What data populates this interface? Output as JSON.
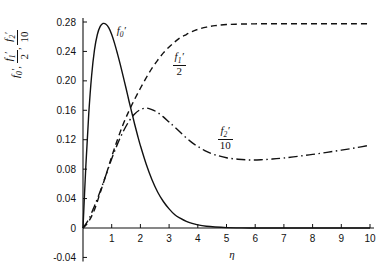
{
  "chart_data": {
    "type": "line",
    "title": "",
    "xlabel": "η",
    "ylabel": "f₀', f₁'/2, f₂'/10",
    "xlim": [
      -0.35,
      10.35
    ],
    "ylim": [
      -0.04,
      0.29
    ],
    "grid": false,
    "legend_position": "inline-annotations",
    "x_ticks": [
      "1",
      "2",
      "3",
      "4",
      "5",
      "6",
      "7",
      "8",
      "9",
      "10"
    ],
    "x_tick_values": [
      1,
      2,
      3,
      4,
      5,
      6,
      7,
      8,
      9,
      10
    ],
    "y_ticks": [
      "0.28",
      "0.24",
      "0.20",
      "0.16",
      "0.12",
      "0.08",
      "0.04",
      "0",
      "-0.04"
    ],
    "y_tick_values": [
      0.28,
      0.24,
      0.2,
      0.16,
      0.12,
      0.08,
      0.04,
      0,
      -0.04
    ],
    "series": [
      {
        "name": "f0prime",
        "label_num": "f",
        "label_sub": "0",
        "label_prime": "′",
        "style": "solid",
        "x": [
          0,
          0.1,
          0.2,
          0.3,
          0.4,
          0.5,
          0.6,
          0.7,
          0.8,
          0.9,
          1.0,
          1.1,
          1.2,
          1.3,
          1.4,
          1.5,
          1.6,
          1.7,
          1.8,
          1.9,
          2.0,
          2.2,
          2.4,
          2.6,
          2.8,
          3.0,
          3.2,
          3.4,
          3.6,
          3.8,
          4.0,
          4.3,
          4.6,
          5.0,
          5.4,
          5.8,
          6.5,
          8.0,
          10.0
        ],
        "y": [
          0,
          0.085,
          0.155,
          0.207,
          0.242,
          0.263,
          0.274,
          0.278,
          0.277,
          0.272,
          0.263,
          0.251,
          0.237,
          0.222,
          0.206,
          0.19,
          0.173,
          0.157,
          0.141,
          0.126,
          0.112,
          0.087,
          0.066,
          0.049,
          0.036,
          0.026,
          0.018,
          0.013,
          0.009,
          0.0062,
          0.0042,
          0.0023,
          0.0013,
          0.0005,
          0.0002,
          0.0001,
          0.0,
          0.0,
          0.0
        ]
      },
      {
        "name": "f1prime_over_2",
        "label_num": "f",
        "label_sub": "1",
        "label_prime": "′",
        "label_den": "2",
        "style": "dashed",
        "x": [
          0,
          0.2,
          0.4,
          0.6,
          0.8,
          1.0,
          1.2,
          1.4,
          1.6,
          1.8,
          2.0,
          2.2,
          2.4,
          2.6,
          2.8,
          3.0,
          3.2,
          3.4,
          3.6,
          3.8,
          4.0,
          4.3,
          4.6,
          5.0,
          5.5,
          6.0,
          6.5,
          7.0,
          7.5,
          8.0,
          8.5,
          9.0,
          9.5,
          10.0
        ],
        "y": [
          0,
          0.009,
          0.025,
          0.048,
          0.072,
          0.097,
          0.12,
          0.141,
          0.159,
          0.175,
          0.19,
          0.204,
          0.217,
          0.228,
          0.238,
          0.246,
          0.253,
          0.259,
          0.263,
          0.267,
          0.27,
          0.273,
          0.275,
          0.2765,
          0.2772,
          0.2775,
          0.2776,
          0.2777,
          0.2777,
          0.2777,
          0.2777,
          0.2777,
          0.2777,
          0.2777
        ]
      },
      {
        "name": "f2prime_over_10",
        "label_num": "f",
        "label_sub": "2",
        "label_prime": "′",
        "label_den": "10",
        "style": "dashdot",
        "x": [
          0,
          0.2,
          0.4,
          0.6,
          0.8,
          1.0,
          1.2,
          1.4,
          1.6,
          1.8,
          2.0,
          2.2,
          2.4,
          2.6,
          2.8,
          3.0,
          3.2,
          3.5,
          3.8,
          4.0,
          4.3,
          4.6,
          5.0,
          5.4,
          5.8,
          6.2,
          6.6,
          7.0,
          7.5,
          8.0,
          8.5,
          9.0,
          9.5,
          10.0
        ],
        "y": [
          0,
          0.012,
          0.03,
          0.05,
          0.072,
          0.094,
          0.114,
          0.131,
          0.145,
          0.155,
          0.161,
          0.163,
          0.161,
          0.157,
          0.151,
          0.144,
          0.137,
          0.126,
          0.116,
          0.111,
          0.104,
          0.0995,
          0.0955,
          0.0935,
          0.0925,
          0.0928,
          0.0938,
          0.0952,
          0.0975,
          0.1,
          0.1028,
          0.1058,
          0.109,
          0.1125
        ]
      }
    ],
    "annotations": [
      {
        "name": "f0-prime-label",
        "text": "f₀′"
      },
      {
        "name": "f1-prime-over-2-label",
        "text": "f₁′/2"
      },
      {
        "name": "f2-prime-over-10-label",
        "text": "f₂′/10"
      }
    ],
    "colors": {
      "curve": "#111111",
      "axis": "#111111",
      "background": "#ffffff"
    }
  },
  "axis": {
    "x_label": "η",
    "y_label_parts": {
      "p1_num": "f",
      "p1_sub": "0",
      "p1_prime": "′",
      "sep1": ",",
      "p2_num": "f",
      "p2_sub": "1",
      "p2_prime": "′",
      "p2_den": "2",
      "sep2": ",",
      "p3_num": "f",
      "p3_sub": "2",
      "p3_prime": "′",
      "p3_den": "10"
    }
  }
}
